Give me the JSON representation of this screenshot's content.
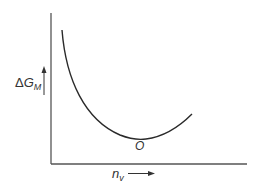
{
  "diagram": {
    "y_axis": {
      "symbol": "Δ",
      "main": "G",
      "subscript": "M",
      "arrow": "up"
    },
    "x_axis": {
      "main": "n",
      "subscript": "v",
      "arrow": "right"
    },
    "minimum_point_label": "O",
    "colors": {
      "line": "#2a2a2a",
      "axis": "#555555",
      "text": "#333333"
    }
  }
}
